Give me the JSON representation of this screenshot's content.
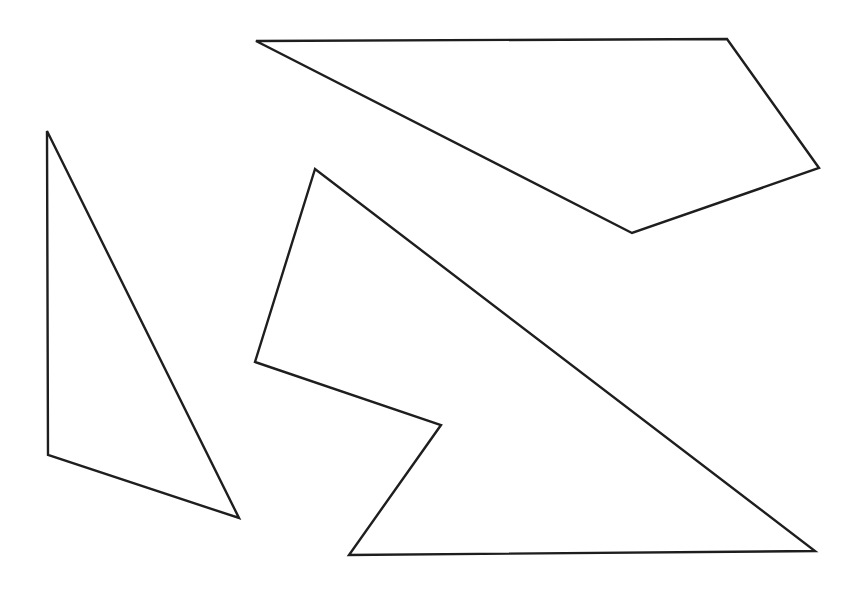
{
  "diagram": {
    "width": 861,
    "height": 589,
    "background": "#ffffff",
    "stroke_color": "#1e1e1e",
    "stroke_width": 2.4,
    "shapes": [
      {
        "id": "triangle-left",
        "kind": "triangle",
        "points": [
          [
            47,
            131
          ],
          [
            48,
            455
          ],
          [
            239,
            518
          ]
        ]
      },
      {
        "id": "quadrilateral-top",
        "kind": "quadrilateral",
        "points": [
          [
            256,
            41
          ],
          [
            727,
            39
          ],
          [
            819,
            168
          ],
          [
            632,
            233
          ]
        ]
      },
      {
        "id": "pentagon-bottom",
        "kind": "pentagon",
        "points": [
          [
            315,
            169
          ],
          [
            255,
            362
          ],
          [
            441,
            425
          ],
          [
            349,
            555
          ],
          [
            815,
            551
          ]
        ]
      }
    ]
  }
}
